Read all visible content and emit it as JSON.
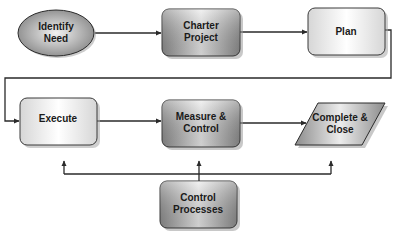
{
  "diagram": {
    "type": "flowchart",
    "nodes": [
      {
        "id": "identify-need",
        "shape": "ellipse",
        "lines": [
          "Identify",
          "Need"
        ],
        "style": "gray-gradient"
      },
      {
        "id": "charter-project",
        "shape": "rounded-rect",
        "lines": [
          "Charter",
          "Project"
        ],
        "style": "gray-gradient"
      },
      {
        "id": "plan",
        "shape": "rounded-rect",
        "lines": [
          "Plan"
        ],
        "style": "light-gradient"
      },
      {
        "id": "execute",
        "shape": "rounded-rect",
        "lines": [
          "Execute"
        ],
        "style": "light-gradient"
      },
      {
        "id": "measure-control",
        "shape": "rounded-rect",
        "lines": [
          "Measure &",
          "Control"
        ],
        "style": "gray-gradient"
      },
      {
        "id": "complete-close",
        "shape": "parallelogram",
        "lines": [
          "Complete &",
          "Close"
        ],
        "style": "gray-gradient"
      },
      {
        "id": "control-processes",
        "shape": "rounded-rect",
        "lines": [
          "Control",
          "Processes"
        ],
        "style": "gray-gradient"
      }
    ],
    "edges": [
      {
        "from": "identify-need",
        "to": "charter-project"
      },
      {
        "from": "charter-project",
        "to": "plan"
      },
      {
        "from": "plan",
        "to": "execute"
      },
      {
        "from": "execute",
        "to": "measure-control"
      },
      {
        "from": "measure-control",
        "to": "complete-close"
      },
      {
        "from": "control-processes",
        "to": "execute"
      },
      {
        "from": "control-processes",
        "to": "measure-control"
      },
      {
        "from": "control-processes",
        "to": "complete-close"
      }
    ],
    "colors": {
      "line": "#2a2a2a",
      "gray_edge": "#8c8c8c",
      "gray_mid": "#e6e6e6",
      "light_edge": "#d4d4d4",
      "light_mid": "#ffffff",
      "shadow": "#9a9a9a",
      "text": "#1a1a1a"
    }
  }
}
